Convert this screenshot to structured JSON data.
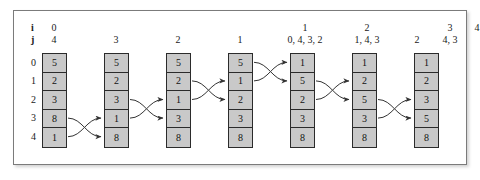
{
  "figure": {
    "title": "",
    "kind": "bubble-sort-trace",
    "header": {
      "i_key": "i",
      "j_key": "j"
    }
  },
  "chart_data": {
    "type": "table",
    "title": "",
    "xlabel": "",
    "ylabel": "",
    "row_labels": [
      "0",
      "1",
      "2",
      "3",
      "4"
    ],
    "i_labels": [
      "0",
      "",
      "",
      "",
      "1",
      "2",
      "",
      "3",
      "4"
    ],
    "j_labels": [
      "4",
      "3",
      "2",
      "1",
      "0, 4, 3, 2",
      "1, 4, 3",
      "2",
      "4, 3",
      ""
    ],
    "columns": [
      {
        "i": "0",
        "j": "4",
        "values": [
          "5",
          "2",
          "3",
          "8",
          "1"
        ]
      },
      {
        "i": "",
        "j": "3",
        "values": [
          "5",
          "2",
          "3",
          "1",
          "8"
        ]
      },
      {
        "i": "",
        "j": "2",
        "values": [
          "5",
          "2",
          "1",
          "3",
          "8"
        ]
      },
      {
        "i": "",
        "j": "1",
        "values": [
          "5",
          "1",
          "2",
          "3",
          "8"
        ]
      },
      {
        "i": "1",
        "j": "0, 4, 3, 2",
        "values": [
          "1",
          "5",
          "2",
          "3",
          "8"
        ]
      },
      {
        "i": "2",
        "j": "1, 4, 3",
        "values": [
          "1",
          "2",
          "5",
          "3",
          "8"
        ]
      },
      {
        "i": "",
        "j": "2",
        "values": [
          "1",
          "2",
          "3",
          "5",
          "8"
        ]
      }
    ],
    "trailing_headers": [
      {
        "i": "3",
        "j": "4, 3"
      },
      {
        "i": "4",
        "j": ""
      }
    ],
    "swaps": [
      {
        "from_column": 0,
        "to_column": 1,
        "rows": [
          3,
          4
        ]
      },
      {
        "from_column": 1,
        "to_column": 2,
        "rows": [
          2,
          3
        ]
      },
      {
        "from_column": 2,
        "to_column": 3,
        "rows": [
          1,
          2
        ]
      },
      {
        "from_column": 3,
        "to_column": 4,
        "rows": [
          0,
          1
        ]
      },
      {
        "from_column": 4,
        "to_column": 5,
        "rows": [
          1,
          2
        ]
      },
      {
        "from_column": 5,
        "to_column": 6,
        "rows": [
          2,
          3
        ]
      }
    ]
  },
  "colors": {
    "cell_fill": "#c9c9c9",
    "cell_border": "#2b2b2b",
    "frame_border": "#7b7b7b",
    "text": "#111111",
    "arrow": "#333333"
  }
}
